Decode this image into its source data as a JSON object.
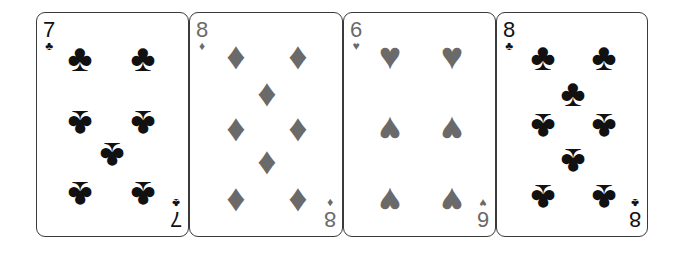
{
  "cards": [
    {
      "rank": "7",
      "suit": "clubs",
      "glyph": "♣",
      "color": "#111111"
    },
    {
      "rank": "8",
      "suit": "diamonds",
      "glyph": "♦",
      "color": "#6a6a6a"
    },
    {
      "rank": "6",
      "suit": "hearts",
      "glyph": "♥",
      "color": "#6a6a6a"
    },
    {
      "rank": "8",
      "suit": "clubs",
      "glyph": "♣",
      "color": "#111111"
    }
  ]
}
